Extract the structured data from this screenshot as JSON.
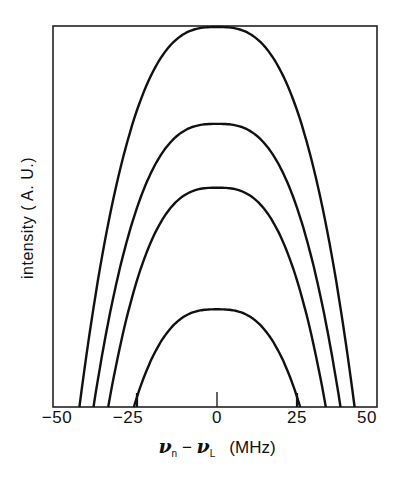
{
  "chart_data": {
    "type": "line",
    "title": "",
    "xlabel": "ν_n − ν_L (MHz)",
    "ylabel": "intensity (A.U.)",
    "xlim": [
      -50,
      50
    ],
    "ylim": [
      0,
      1
    ],
    "grid": false,
    "legend": null,
    "x_ticks": [
      -50,
      -25,
      0,
      25,
      50
    ],
    "x_tick_labels": [
      "−50",
      "−25",
      "0",
      "25",
      "50"
    ],
    "center_tick_x": 0,
    "series": [
      {
        "name": "curve 1",
        "peak_x": 0,
        "peak_intensity": 1.0,
        "half_width_mhz": 43
      },
      {
        "name": "curve 2",
        "peak_x": 0,
        "peak_intensity": 0.745,
        "half_width_mhz": 38.6
      },
      {
        "name": "curve 3",
        "peak_x": 0,
        "peak_intensity": 0.577,
        "half_width_mhz": 34
      },
      {
        "name": "curve 4",
        "peak_x": 0,
        "peak_intensity": 0.257,
        "half_width_mhz": 26,
        "edge_markers_x": [
          -25,
          25
        ]
      }
    ]
  },
  "axis": {
    "xlabel_var1": "ν",
    "xlabel_sub1": "n",
    "xlabel_minus": " − ",
    "xlabel_var2": "ν",
    "xlabel_sub2": "L",
    "xlabel_units": "(MHz)",
    "ylabel_text": "intensity  ( A. U.)",
    "tick_labels": [
      "−50",
      "−25",
      "0",
      "25",
      "50"
    ]
  }
}
